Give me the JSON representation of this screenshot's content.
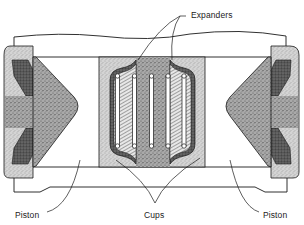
{
  "diagram": {
    "labels": {
      "expanders": "Expanders",
      "piston_left": "Piston",
      "cups": "Cups",
      "piston_right": "Piston"
    },
    "colors": {
      "line": "#1a1a1a",
      "stipple_light": "#c9c9c9",
      "stipple_dark": "#5e5e5e",
      "hatch": "#8a8a8a",
      "background": "#ffffff"
    }
  }
}
